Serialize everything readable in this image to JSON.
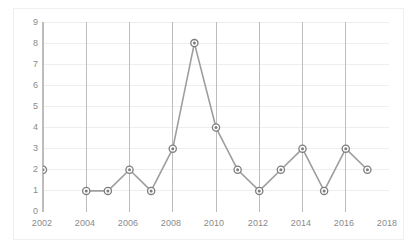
{
  "chart_data": {
    "type": "line",
    "title": "",
    "subtitle": "",
    "xlabel": "",
    "ylabel": "",
    "x": [
      2002,
      2004,
      2005,
      2006,
      2007,
      2008,
      2009,
      2010,
      2011,
      2012,
      2013,
      2014,
      2015,
      2016,
      2017
    ],
    "values": [
      2,
      1,
      1,
      2,
      1,
      3,
      8,
      4,
      2,
      1,
      2,
      3,
      1,
      3,
      2
    ],
    "series": [
      {
        "name": "Series 1",
        "points": [
          {
            "x": 2002,
            "y": 2
          },
          {
            "x": 2004,
            "y": 1
          },
          {
            "x": 2005,
            "y": 1
          },
          {
            "x": 2006,
            "y": 2
          },
          {
            "x": 2007,
            "y": 1
          },
          {
            "x": 2008,
            "y": 3
          },
          {
            "x": 2009,
            "y": 8
          },
          {
            "x": 2010,
            "y": 4
          },
          {
            "x": 2011,
            "y": 2
          },
          {
            "x": 2012,
            "y": 1
          },
          {
            "x": 2013,
            "y": 2
          },
          {
            "x": 2014,
            "y": 3
          },
          {
            "x": 2015,
            "y": 1
          },
          {
            "x": 2016,
            "y": 3
          },
          {
            "x": 2017,
            "y": 2
          }
        ],
        "gaps": [
          2003
        ],
        "line_color": "#9e9e9e",
        "marker_color": "#7d7d7d"
      }
    ],
    "xlim": [
      2002,
      2018
    ],
    "ylim": [
      0,
      9
    ],
    "y_ticks": [
      0,
      1,
      2,
      3,
      4,
      5,
      6,
      7,
      8,
      9
    ],
    "x_ticks": [
      2002,
      2004,
      2006,
      2008,
      2010,
      2012,
      2014,
      2016,
      2018
    ],
    "x_tick_labels": [
      "2002",
      "2004",
      "2006",
      "2008",
      "2010",
      "2012",
      "2014",
      "2016",
      "2018"
    ],
    "y_tick_labels": [
      "0",
      "1",
      "2",
      "3",
      "4",
      "5",
      "6",
      "7",
      "8",
      "9"
    ],
    "grid": {
      "horizontal": true,
      "vertical": true,
      "horizontal_color": "#eeeeee",
      "vertical_color": "#bdbdbd"
    },
    "legend": {
      "visible": false,
      "position": "none"
    },
    "background_color": "#ffffff",
    "frame_color": "#f0f0f0",
    "axis_text_color": "#8a8a8a"
  }
}
